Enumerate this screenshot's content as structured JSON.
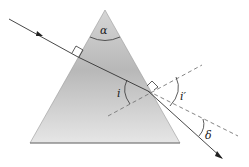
{
  "diagram": {
    "labels": {
      "apex_angle": "α",
      "incidence_angle": "i",
      "emergence_angle": "i′",
      "deviation_angle": "δ"
    },
    "colors": {
      "prism_top": "#d2d2d2",
      "prism_mid": "#b9b9b9",
      "prism_bottom": "#e4e4e4",
      "ray": "#333333",
      "dashed": "#777777"
    }
  }
}
